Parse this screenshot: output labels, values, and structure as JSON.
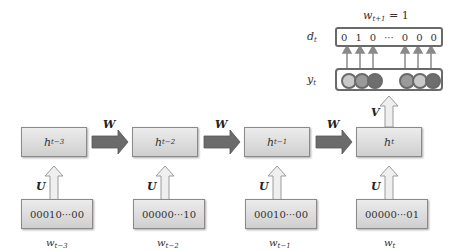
{
  "diagram": {
    "type": "unrolled-rnn-language-model",
    "hidden_states": [
      {
        "label": "h",
        "sub": "t−3"
      },
      {
        "label": "h",
        "sub": "t−2"
      },
      {
        "label": "h",
        "sub": "t−1"
      },
      {
        "label": "h",
        "sub": "t"
      }
    ],
    "inputs": [
      {
        "vector": "00010···00",
        "label": "w",
        "sub": "t−3"
      },
      {
        "vector": "00000···10",
        "label": "w",
        "sub": "t−2"
      },
      {
        "vector": "00010···00",
        "label": "w",
        "sub": "t−1"
      },
      {
        "vector": "00000···01",
        "label": "w",
        "sub": "t"
      }
    ],
    "weights": {
      "recurrent": "W",
      "input": "U",
      "output": "V"
    },
    "output": {
      "y_label": "y",
      "y_sub": "t",
      "d_label": "d",
      "d_sub": "t",
      "d_values": [
        "0",
        "1",
        "0",
        "···",
        "0",
        "0",
        "0"
      ],
      "target_label": "w",
      "target_sub": "t+1",
      "target_eq": "= 1",
      "circle_colors": [
        "#c9c9c9",
        "#9a9a9a",
        "#6e6e6e",
        "#9a9a9a",
        "#c9c9c9",
        "#6e6e6e"
      ]
    },
    "colors": {
      "box_fill": "#dcdcdc",
      "box_border": "#8a8a8a",
      "arrow_dark": "#6b6b6b",
      "arrow_light": "#e8e8e8",
      "vector_border": "#6a6a6a"
    }
  }
}
